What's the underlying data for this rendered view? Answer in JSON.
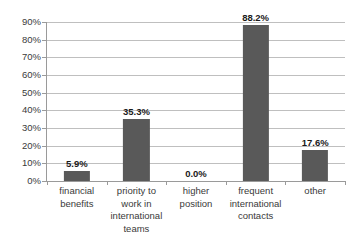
{
  "chart_data": {
    "type": "bar",
    "title": "",
    "subtitle": "",
    "xlabel": "",
    "ylabel": "",
    "categories": [
      "financial benefits",
      "priority to work in international teams",
      "higher position",
      "frequent international contacts",
      "other"
    ],
    "category_lines": [
      [
        "financial",
        "benefits"
      ],
      [
        "priority to",
        "work in",
        "international",
        "teams"
      ],
      [
        "higher",
        "position"
      ],
      [
        "frequent",
        "international",
        "contacts"
      ],
      [
        "other"
      ]
    ],
    "values": [
      5.9,
      35.3,
      0.0,
      88.2,
      17.6
    ],
    "data_labels": [
      "5.9%",
      "35.3%",
      "0.0%",
      "88.2%",
      "17.6%"
    ],
    "ylim": [
      0,
      90
    ],
    "ytick_values": [
      0,
      10,
      20,
      30,
      40,
      50,
      60,
      70,
      80,
      90
    ],
    "ytick_labels": [
      "0%",
      "10%",
      "20%",
      "30%",
      "40%",
      "50%",
      "60%",
      "70%",
      "80%",
      "90%"
    ],
    "grid": true,
    "legend": false,
    "legend_position": "none",
    "colors": {
      "bar": "#595959",
      "gridline": "#bfbfbf",
      "axis": "#9a9a9a",
      "label_text": "#3a3a3a",
      "value_text": "#1a1a1a",
      "background": "#ffffff"
    }
  }
}
